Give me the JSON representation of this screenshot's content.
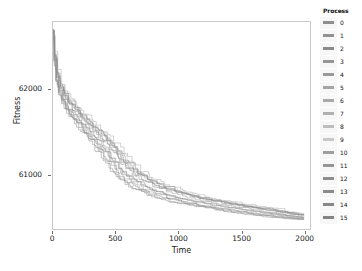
{
  "chart_data": {
    "type": "line",
    "title": "",
    "xlabel": "Time",
    "ylabel": "Fitness",
    "xlim": [
      0,
      2050
    ],
    "ylim": [
      60350,
      62800
    ],
    "xticks": [
      0,
      500,
      1000,
      1500,
      2000
    ],
    "xtick_labels": [
      "0",
      "500",
      "1000",
      "1500",
      "2000"
    ],
    "yticks": [
      61000,
      62000
    ],
    "ytick_labels": [
      "61000",
      "62000"
    ],
    "grid": false,
    "legend_position": "right",
    "legend_title": "Process",
    "legend_entries": [
      {
        "label": "0",
        "color": "#8f8f8f"
      },
      {
        "label": "1",
        "color": "#929292"
      },
      {
        "label": "2",
        "color": "#8b8b8b"
      },
      {
        "label": "3",
        "color": "#969696"
      },
      {
        "label": "4",
        "color": "#9a9a9a"
      },
      {
        "label": "5",
        "color": "#a5a5a5"
      },
      {
        "label": "6",
        "color": "#a9a9a9"
      },
      {
        "label": "7",
        "color": "#b0b0b0"
      },
      {
        "label": "8",
        "color": "#bdbdbd"
      },
      {
        "label": "9",
        "color": "#c8c8c8"
      },
      {
        "label": "10",
        "color": "#9e9e9e"
      },
      {
        "label": "11",
        "color": "#959595"
      },
      {
        "label": "12",
        "color": "#8d8d8d"
      },
      {
        "label": "13",
        "color": "#8a8a8a"
      },
      {
        "label": "14",
        "color": "#878787"
      },
      {
        "label": "15",
        "color": "#848484"
      }
    ],
    "series": [
      {
        "name": "0",
        "color": "#8f8f8f",
        "x": [
          0,
          10,
          25,
          45,
          70,
          100,
          140,
          185,
          240,
          300,
          360,
          430,
          500,
          580,
          660,
          750,
          850,
          960,
          1080,
          1200,
          1320,
          1450,
          1600,
          1760,
          1900,
          2000
        ],
        "y": [
          62710,
          62350,
          62130,
          61980,
          61880,
          61790,
          61700,
          61620,
          61530,
          61420,
          61300,
          61150,
          61000,
          60900,
          60820,
          60760,
          60710,
          60670,
          60640,
          60610,
          60580,
          60550,
          60520,
          60495,
          60475,
          60465
        ]
      },
      {
        "name": "1",
        "color": "#929292",
        "x": [
          0,
          12,
          30,
          55,
          85,
          120,
          165,
          215,
          275,
          340,
          410,
          480,
          560,
          650,
          740,
          840,
          950,
          1060,
          1180,
          1310,
          1440,
          1580,
          1730,
          1870,
          2000
        ],
        "y": [
          62700,
          62400,
          62180,
          62020,
          61930,
          61850,
          61760,
          61680,
          61600,
          61510,
          61400,
          61270,
          61120,
          61000,
          60910,
          60840,
          60780,
          60730,
          60690,
          60655,
          60620,
          60585,
          60550,
          60515,
          60480
        ]
      },
      {
        "name": "2",
        "color": "#8b8b8b",
        "x": [
          0,
          8,
          22,
          42,
          68,
          98,
          135,
          180,
          230,
          290,
          350,
          420,
          495,
          575,
          665,
          760,
          865,
          975,
          1095,
          1215,
          1345,
          1480,
          1620,
          1780,
          1930,
          2000
        ],
        "y": [
          62705,
          62330,
          62100,
          61950,
          61860,
          61770,
          61680,
          61590,
          61500,
          61390,
          61270,
          61130,
          61000,
          60895,
          60815,
          60755,
          60705,
          60665,
          60630,
          60600,
          60570,
          60540,
          60510,
          60485,
          60468,
          60462
        ]
      },
      {
        "name": "3",
        "color": "#969696",
        "x": [
          0,
          14,
          35,
          62,
          95,
          135,
          180,
          235,
          295,
          360,
          430,
          510,
          595,
          690,
          790,
          895,
          1005,
          1125,
          1250,
          1385,
          1520,
          1670,
          1820,
          1960,
          2000
        ],
        "y": [
          62695,
          62430,
          62210,
          62060,
          61960,
          61875,
          61790,
          61705,
          61620,
          61530,
          61420,
          61290,
          61140,
          61010,
          60920,
          60850,
          60790,
          60740,
          60700,
          60660,
          60625,
          60590,
          60555,
          60520,
          60510
        ]
      },
      {
        "name": "4",
        "color": "#9a9a9a",
        "x": [
          0,
          10,
          28,
          50,
          78,
          112,
          155,
          205,
          260,
          325,
          395,
          470,
          550,
          640,
          735,
          835,
          945,
          1055,
          1175,
          1300,
          1430,
          1570,
          1720,
          1870,
          2000
        ],
        "y": [
          62702,
          62370,
          62150,
          61995,
          61900,
          61815,
          61730,
          61645,
          61555,
          61455,
          61340,
          61200,
          61050,
          60940,
          60860,
          60795,
          60745,
          60700,
          60665,
          60630,
          60600,
          60568,
          60538,
          60508,
          60480
        ]
      },
      {
        "name": "5",
        "color": "#a5a5a5",
        "x": [
          0,
          16,
          38,
          65,
          100,
          142,
          190,
          245,
          310,
          380,
          455,
          540,
          630,
          725,
          825,
          930,
          1045,
          1165,
          1290,
          1420,
          1560,
          1700,
          1850,
          2000
        ],
        "y": [
          62690,
          62450,
          62240,
          62085,
          61985,
          61900,
          61815,
          61730,
          61645,
          61555,
          61450,
          61320,
          61170,
          61030,
          60935,
          60865,
          60805,
          60755,
          60712,
          60675,
          60640,
          60605,
          60570,
          60500
        ]
      },
      {
        "name": "6",
        "color": "#a9a9a9",
        "x": [
          0,
          9,
          24,
          46,
          72,
          104,
          145,
          192,
          248,
          310,
          378,
          452,
          532,
          620,
          715,
          818,
          928,
          1040,
          1160,
          1285,
          1415,
          1555,
          1705,
          1855,
          2000
        ],
        "y": [
          62708,
          62340,
          62120,
          61970,
          61875,
          61785,
          61695,
          61610,
          61520,
          61415,
          61295,
          61155,
          61010,
          60905,
          60825,
          60765,
          60715,
          60672,
          60638,
          60606,
          60576,
          60546,
          60516,
          60490,
          60470
        ]
      },
      {
        "name": "7",
        "color": "#b0b0b0",
        "x": [
          0,
          13,
          32,
          58,
          90,
          128,
          172,
          225,
          285,
          350,
          422,
          500,
          585,
          678,
          778,
          885,
          995,
          1115,
          1240,
          1372,
          1510,
          1655,
          1805,
          1950,
          2000
        ],
        "y": [
          62698,
          62410,
          62195,
          62040,
          61945,
          61860,
          61775,
          61690,
          61605,
          61515,
          61405,
          61275,
          61125,
          61005,
          60915,
          60845,
          60788,
          60742,
          60702,
          60665,
          60632,
          60598,
          60562,
          60528,
          60515
        ]
      },
      {
        "name": "8",
        "color": "#bdbdbd",
        "x": [
          0,
          11,
          27,
          48,
          75,
          108,
          150,
          198,
          255,
          318,
          388,
          465,
          548,
          638,
          733,
          835,
          945,
          1058,
          1180,
          1308,
          1440,
          1585,
          1735,
          1885,
          2000
        ],
        "y": [
          62703,
          62360,
          62140,
          61988,
          61892,
          61805,
          61718,
          61632,
          61542,
          61440,
          61325,
          61185,
          61040,
          60930,
          60852,
          60790,
          60740,
          60698,
          60662,
          60628,
          60598,
          60566,
          60534,
          60504,
          60482
        ]
      },
      {
        "name": "9",
        "color": "#c8c8c8",
        "x": [
          0,
          15,
          36,
          60,
          92,
          130,
          176,
          230,
          292,
          358,
          430,
          512,
          600,
          695,
          795,
          900,
          1012,
          1132,
          1258,
          1392,
          1530,
          1678,
          1830,
          1980,
          2000
        ],
        "y": [
          62692,
          62440,
          62225,
          62070,
          61970,
          61885,
          61800,
          61715,
          61630,
          61540,
          61432,
          61302,
          61152,
          61018,
          60925,
          60856,
          60796,
          60748,
          60706,
          60668,
          60634,
          60600,
          60566,
          60532,
          60520
        ]
      },
      {
        "name": "10",
        "color": "#9e9e9e",
        "x": [
          0,
          10,
          26,
          47,
          74,
          106,
          147,
          194,
          250,
          312,
          380,
          456,
          538,
          626,
          720,
          822,
          932,
          1044,
          1165,
          1292,
          1425,
          1565,
          1715,
          1865,
          2000
        ],
        "y": [
          62706,
          62345,
          62125,
          61975,
          61880,
          61790,
          61700,
          61614,
          61524,
          61420,
          61300,
          61160,
          61015,
          60908,
          60828,
          60768,
          60718,
          60676,
          60640,
          60608,
          60578,
          60548,
          60518,
          60492,
          60472
        ]
      },
      {
        "name": "11",
        "color": "#959595",
        "x": [
          0,
          12,
          31,
          56,
          87,
          124,
          168,
          220,
          280,
          345,
          416,
          494,
          578,
          670,
          768,
          872,
          982,
          1100,
          1225,
          1355,
          1492,
          1638,
          1788,
          1935,
          2000
        ],
        "y": [
          62699,
          62395,
          62175,
          62015,
          61922,
          61838,
          61752,
          61668,
          61582,
          61492,
          61382,
          61252,
          61105,
          60992,
          60905,
          60838,
          60782,
          60736,
          60696,
          60660,
          60627,
          60594,
          60558,
          60524,
          60508
        ]
      },
      {
        "name": "12",
        "color": "#8d8d8d",
        "x": [
          0,
          9,
          23,
          44,
          70,
          101,
          141,
          187,
          242,
          303,
          370,
          444,
          524,
          612,
          706,
          806,
          915,
          1026,
          1146,
          1272,
          1405,
          1545,
          1695,
          1848,
          2000
        ],
        "y": [
          62707,
          62335,
          62112,
          61962,
          61868,
          61778,
          61688,
          61602,
          61512,
          61408,
          61288,
          61148,
          61005,
          60900,
          60820,
          60760,
          60710,
          60668,
          60634,
          60602,
          60572,
          60542,
          60512,
          60486,
          60466
        ]
      },
      {
        "name": "13",
        "color": "#8a8a8a",
        "x": [
          0,
          13,
          33,
          59,
          91,
          130,
          175,
          228,
          288,
          354,
          426,
          505,
          590,
          684,
          784,
          890,
          1000,
          1120,
          1246,
          1378,
          1516,
          1662,
          1812,
          1958,
          2000
        ],
        "y": [
          62697,
          62405,
          62188,
          62030,
          61938,
          61852,
          61766,
          61682,
          61596,
          61506,
          61396,
          61266,
          61118,
          61000,
          60910,
          60842,
          60785,
          60739,
          60699,
          60662,
          60629,
          60595,
          60559,
          60525,
          60512
        ]
      },
      {
        "name": "14",
        "color": "#878787",
        "x": [
          0,
          11,
          29,
          52,
          80,
          115,
          158,
          208,
          265,
          330,
          400,
          478,
          560,
          652,
          748,
          850,
          960,
          1072,
          1195,
          1322,
          1455,
          1598,
          1748,
          1898,
          2000
        ],
        "y": [
          62704,
          62365,
          62145,
          61990,
          61894,
          61808,
          61722,
          61636,
          61546,
          61444,
          61330,
          61190,
          61042,
          60932,
          60854,
          60792,
          60742,
          60700,
          60663,
          60630,
          60600,
          60568,
          60536,
          60506,
          60484
        ]
      },
      {
        "name": "15",
        "color": "#848484",
        "x": [
          0,
          14,
          34,
          61,
          94,
          133,
          179,
          233,
          294,
          362,
          435,
          516,
          604,
          700,
          800,
          906,
          1018,
          1138,
          1264,
          1398,
          1536,
          1684,
          1836,
          1986,
          2000
        ],
        "y": [
          62694,
          62420,
          62205,
          62050,
          61955,
          61870,
          61784,
          61700,
          61614,
          61524,
          61414,
          61284,
          61134,
          61012,
          60920,
          60852,
          60793,
          60745,
          60704,
          60666,
          60632,
          60598,
          60563,
          60529,
          60524
        ]
      }
    ]
  }
}
